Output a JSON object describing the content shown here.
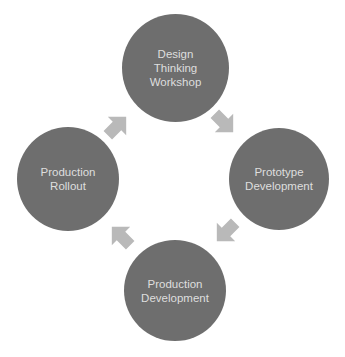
{
  "diagram": {
    "type": "cycle",
    "colors": {
      "node_fill": "#6e6e6e",
      "node_text": "#dedede",
      "arrow_fill": "#b9b9b9",
      "background": "#ffffff"
    },
    "nodes": [
      {
        "id": "design",
        "label": "Design\nThinking\nWorkshop"
      },
      {
        "id": "prototype",
        "label": "Prototype\nDevelopment"
      },
      {
        "id": "production-dev",
        "label": "Production\nDevelopment"
      },
      {
        "id": "rollout",
        "label": "Production\nRollout"
      }
    ],
    "edges": [
      {
        "from": "design",
        "to": "prototype",
        "arrow": "southeast"
      },
      {
        "from": "prototype",
        "to": "production-dev",
        "arrow": "southwest"
      },
      {
        "from": "production-dev",
        "to": "rollout",
        "arrow": "northwest"
      },
      {
        "from": "rollout",
        "to": "design",
        "arrow": "northeast"
      }
    ]
  }
}
